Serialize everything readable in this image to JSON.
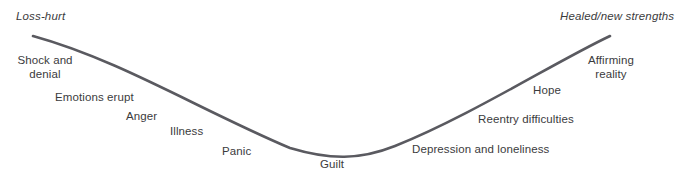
{
  "diagram": {
    "curve": {
      "color": "#5a5a60",
      "width": 2.6,
      "path": "M 33 36 C 120 60, 200 110, 290 148 C 330 160, 360 160, 395 146 C 470 116, 555 62, 610 36"
    },
    "endpoints": {
      "left": "Loss-hurt",
      "right": "Healed/new strengths"
    },
    "stages": [
      {
        "id": "shock-and-denial",
        "label": "Shock and\ndenial"
      },
      {
        "id": "emotions-erupt",
        "label": "Emotions erupt"
      },
      {
        "id": "anger",
        "label": "Anger"
      },
      {
        "id": "illness",
        "label": "Illness"
      },
      {
        "id": "panic",
        "label": "Panic"
      },
      {
        "id": "guilt",
        "label": "Guilt"
      },
      {
        "id": "depression-and-loneliness",
        "label": "Depression and loneliness"
      },
      {
        "id": "reentry-difficulties",
        "label": "Reentry difficulties"
      },
      {
        "id": "hope",
        "label": "Hope"
      },
      {
        "id": "affirming-reality",
        "label": "Affirming\nreality"
      }
    ],
    "colors": {
      "background": "#ffffff",
      "text": "#3b3b3d",
      "curve": "#5a5a60"
    }
  }
}
